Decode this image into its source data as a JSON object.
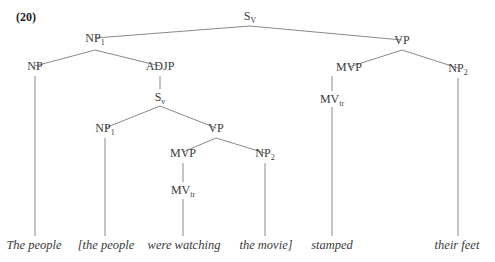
{
  "example_number": "(20)",
  "nodes": [
    {
      "id": "sv_root",
      "label": "S",
      "sub": "V",
      "x": 250,
      "y": 10
    },
    {
      "id": "np1_top",
      "label": "NP",
      "sub": "1",
      "x": 95,
      "y": 32
    },
    {
      "id": "vp_top",
      "label": "VP",
      "sub": "",
      "x": 402,
      "y": 34
    },
    {
      "id": "np_left",
      "label": "NP",
      "sub": "",
      "x": 35,
      "y": 60
    },
    {
      "id": "adjp",
      "label": "ADJP",
      "sub": "",
      "x": 160,
      "y": 60
    },
    {
      "id": "mvp_right",
      "label": "MVP",
      "sub": "",
      "x": 349,
      "y": 61
    },
    {
      "id": "np2_right",
      "label": "NP",
      "sub": "2",
      "x": 458,
      "y": 62
    },
    {
      "id": "sv_inner",
      "label": "S",
      "sub": "v",
      "x": 160,
      "y": 91
    },
    {
      "id": "mvtr_right",
      "label": "MV",
      "sub": "tr",
      "x": 332,
      "y": 93
    },
    {
      "id": "np1_inner",
      "label": "NP",
      "sub": "1",
      "x": 105,
      "y": 122
    },
    {
      "id": "vp_inner",
      "label": "VP",
      "sub": "",
      "x": 216,
      "y": 122
    },
    {
      "id": "mvp_inner",
      "label": "MVP",
      "sub": "",
      "x": 183,
      "y": 147
    },
    {
      "id": "np2_inner",
      "label": "NP",
      "sub": "2",
      "x": 265,
      "y": 147
    },
    {
      "id": "mvtr_inner",
      "label": "MV",
      "sub": "tr",
      "x": 183,
      "y": 184
    }
  ],
  "edges": [
    [
      95,
      38,
      250,
      26
    ],
    [
      250,
      26,
      402,
      40
    ],
    [
      35,
      66,
      95,
      50
    ],
    [
      95,
      50,
      160,
      66
    ],
    [
      349,
      67,
      402,
      50
    ],
    [
      402,
      50,
      458,
      68
    ],
    [
      160,
      76,
      160,
      89
    ],
    [
      105,
      128,
      160,
      106
    ],
    [
      160,
      106,
      216,
      128
    ],
    [
      183,
      152,
      216,
      138
    ],
    [
      216,
      138,
      265,
      153
    ],
    [
      183,
      163,
      183,
      182
    ],
    [
      35,
      76,
      35,
      236
    ],
    [
      105,
      138,
      105,
      236
    ],
    [
      183,
      199,
      183,
      236
    ],
    [
      265,
      163,
      265,
      236
    ],
    [
      332,
      76,
      332,
      91
    ],
    [
      332,
      107,
      332,
      236
    ],
    [
      458,
      78,
      458,
      236
    ]
  ],
  "leaves": [
    {
      "id": "leaf-the-people",
      "text": "The people",
      "x": 34,
      "y": 238
    },
    {
      "id": "leaf-bracket-the-people",
      "text": "[the people",
      "x": 106,
      "y": 238
    },
    {
      "id": "leaf-were-watching",
      "text": "were watching",
      "x": 184,
      "y": 238
    },
    {
      "id": "leaf-the-movie",
      "text": "the movie]",
      "x": 266,
      "y": 238
    },
    {
      "id": "leaf-stamped",
      "text": "stamped",
      "x": 332,
      "y": 238
    },
    {
      "id": "leaf-their-feet",
      "text": "their feet",
      "x": 457,
      "y": 238
    }
  ],
  "line_color": "#8a8a8a"
}
